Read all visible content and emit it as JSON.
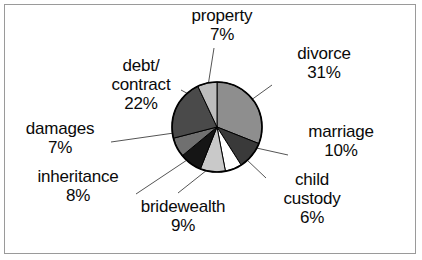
{
  "figure": {
    "background_color": "#ffffff",
    "border_color": "#9a9a9a",
    "label_text_color": "#0a0a0a",
    "leader_line_color": "#555555",
    "pie_outline_color": "#000000"
  },
  "chart_data": {
    "type": "pie",
    "title": "",
    "subtitle": "",
    "xlabel": "",
    "ylabel": "",
    "grid": false,
    "legend_position": "none",
    "labels_outside": true,
    "start_angle_deg": 0,
    "direction": "clockwise",
    "center_x": 217,
    "center_y": 127,
    "radius": 45,
    "categories": [
      "divorce",
      "marriage",
      "child custody",
      "bridewealth",
      "inheritance",
      "damages",
      "debt/contract",
      "property"
    ],
    "values": [
      31,
      10,
      6,
      9,
      8,
      7,
      22,
      7
    ],
    "value_suffix": "%",
    "colors": [
      "#8e8e8e",
      "#3a3a3a",
      "#ffffff",
      "#c9c9c9",
      "#151515",
      "#707070",
      "#4a4a4a",
      "#bdbdbd"
    ],
    "slices": [
      {
        "label": "divorce",
        "value": 31,
        "percent_text": "31%",
        "color": "#8e8e8e"
      },
      {
        "label": "marriage",
        "value": 10,
        "percent_text": "10%",
        "color": "#3a3a3a"
      },
      {
        "label": "child custody",
        "value": 6,
        "percent_text": "6%",
        "color": "#ffffff"
      },
      {
        "label": "bridewealth",
        "value": 9,
        "percent_text": "9%",
        "color": "#c9c9c9"
      },
      {
        "label": "inheritance",
        "value": 8,
        "percent_text": "8%",
        "color": "#151515"
      },
      {
        "label": "damages",
        "value": 7,
        "percent_text": "7%",
        "color": "#707070"
      },
      {
        "label": "debt/contract",
        "value": 22,
        "percent_text": "22%",
        "color": "#4a4a4a"
      },
      {
        "label": "property",
        "value": 7,
        "percent_text": "7%",
        "color": "#bdbdbd"
      }
    ]
  },
  "labels": {
    "property": {
      "name": "property",
      "percent": "7%"
    },
    "divorce": {
      "name": "divorce",
      "percent": "31%"
    },
    "debt": {
      "line1": "debt/",
      "line2": "contract",
      "percent": "22%"
    },
    "damages": {
      "name": "damages",
      "percent": "7%"
    },
    "marriage": {
      "name": "marriage",
      "percent": "10%"
    },
    "inheritance": {
      "name": "inheritance",
      "percent": "8%"
    },
    "child": {
      "line1": "child",
      "line2": "custody",
      "percent": "6%"
    },
    "bridewealth": {
      "name": "bridewealth",
      "percent": "9%"
    }
  }
}
